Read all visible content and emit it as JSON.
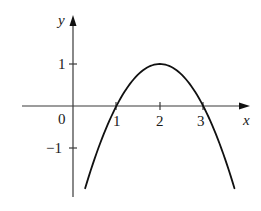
{
  "chart_data": {
    "type": "line",
    "title": "",
    "xlabel": "x",
    "ylabel": "y",
    "function": "y = 1 - (x - 2)^2",
    "xlim": [
      -1.6,
      4.1
    ],
    "ylim": [
      -2.1,
      2.1
    ],
    "grid": false,
    "legend": null,
    "x_ticks": [
      1,
      2,
      3
    ],
    "x_tick_labels": [
      "1",
      "2",
      "3"
    ],
    "y_ticks": [
      1,
      -1
    ],
    "y_tick_labels": [
      "1",
      "−1"
    ],
    "origin_label": "0",
    "series": [
      {
        "name": "parabola",
        "x": [
          0.28,
          0.5,
          1.0,
          1.5,
          2.0,
          2.5,
          3.0,
          3.5,
          3.72
        ],
        "y": [
          -1.96,
          -1.25,
          0.0,
          0.75,
          1.0,
          0.75,
          0.0,
          -1.25,
          -1.96
        ]
      }
    ],
    "annotations": [
      {
        "text": "vertex",
        "x": 2,
        "y": 1
      },
      {
        "text": "root",
        "x": 1,
        "y": 0
      },
      {
        "text": "root",
        "x": 3,
        "y": 0
      }
    ]
  },
  "labels": {
    "x_axis": "x",
    "y_axis": "y",
    "origin": "0",
    "x1": "1",
    "x2": "2",
    "x3": "3",
    "y1": "1",
    "ym1": "−1"
  },
  "colors": {
    "axis": "#3a3a3a",
    "curve": "#111111",
    "text": "#1a1a1a"
  }
}
